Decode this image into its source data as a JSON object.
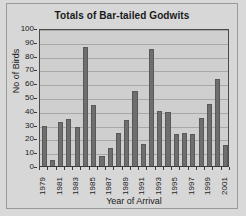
{
  "chart_data": {
    "type": "bar",
    "title": "Totals of Bar-tailed Godwits",
    "xlabel": "Year of Arrival",
    "ylabel": "No of Birds",
    "categories": [
      "1979",
      "1980",
      "1981",
      "1982",
      "1983",
      "1984",
      "1985",
      "1986",
      "1987",
      "1988",
      "1989",
      "1990",
      "1991",
      "1992",
      "1993",
      "1994",
      "1995",
      "1996",
      "1997",
      "1998",
      "1999",
      "2000",
      "2001"
    ],
    "values": [
      29,
      4,
      32,
      34,
      28,
      86,
      44,
      7,
      13,
      24,
      33,
      54,
      16,
      85,
      40,
      39,
      23,
      24,
      23,
      35,
      45,
      63,
      15
    ],
    "ylim": [
      0,
      100
    ],
    "ytick_labels": [
      "0",
      "10",
      "20",
      "30",
      "40",
      "50",
      "60",
      "70",
      "80",
      "90",
      "100"
    ],
    "ytick_values": [
      0,
      10,
      20,
      30,
      40,
      50,
      60,
      70,
      80,
      90,
      100
    ],
    "xtick_labels_shown": [
      "1979",
      "1981",
      "1983",
      "1985",
      "1987",
      "1989",
      "1991",
      "1993",
      "1995",
      "1997",
      "1999",
      "2001"
    ],
    "xtick_label_rotation": "-90",
    "grid": "horizontal",
    "legend": "none",
    "bar_color": "#6e6e6e",
    "plot_background": "#cfcfcf",
    "figure_background": "#d7d7d7",
    "axis_color": "#3a3a3a",
    "gridline_color": "#a8a8a8"
  }
}
